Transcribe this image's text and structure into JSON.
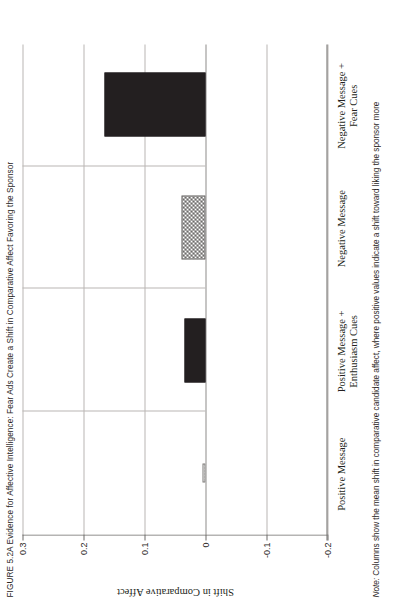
{
  "figure": {
    "caption_prefix": "FIGURE 5.2A",
    "caption": "FIGURE 5.2A Evidence for Affective Intelligence: Fear Ads Create a Shift in Comparative Affect Favoring the Sponsor",
    "note_label": "Note:",
    "note": "Note: Columns show the mean shift in comparative candidate affect, where positive values indicate a shift toward liking the sponsor more"
  },
  "chart_data": {
    "type": "bar",
    "title": "FIGURE 5.2A Evidence for Affective Intelligence: Fear Ads Create a Shift in Comparative Affect Favoring the Sponsor",
    "orientation": "vertical",
    "categories": [
      "Positive Message",
      "Positive Message +\nEnthusiasm Cues",
      "Negative Message",
      "Negative Message +\nFear Cues"
    ],
    "category_labels": [
      {
        "line1": "Positive Message",
        "line2": ""
      },
      {
        "line1": "Positive Message +",
        "line2": "Enthusiasm Cues"
      },
      {
        "line1": "Negative Message",
        "line2": ""
      },
      {
        "line1": "Negative Message +",
        "line2": "Fear Cues"
      }
    ],
    "values": [
      0.005,
      0.035,
      0.04,
      0.165
    ],
    "fills": [
      "dotted",
      "solid",
      "checker",
      "solid"
    ],
    "xlabel": "",
    "ylabel": "Shift in Comparative Affect",
    "ylim": [
      -0.2,
      0.3
    ],
    "yticks": [
      0.3,
      0.2,
      0.1,
      0,
      -0.1,
      -0.2
    ],
    "ytick_labels": [
      "0.3",
      "0.2",
      "0.1",
      "0",
      "-0.1",
      "-0.2"
    ],
    "grid": true,
    "legend": "none",
    "colors": {
      "bar_solid": "#231f20",
      "bar_checker": "#4a4746",
      "bar_dotted": "#3b3836",
      "axis": "#6d6a68",
      "gridline": "#b9b6b4",
      "text": "#231f20",
      "background": "#ffffff"
    }
  }
}
